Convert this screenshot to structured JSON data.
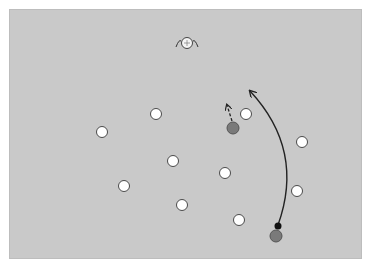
{
  "board": {
    "background": "#c9c9c9",
    "x": 9,
    "y": 9,
    "width": 353,
    "height": 250
  },
  "colors": {
    "white_marker": "#ffffff",
    "marker_stroke": "#4a4a4a",
    "gray_ball": "#7a7a7a",
    "black_dot": "#111111",
    "arrow": "#222222"
  },
  "white_markers": [
    {
      "x": 102,
      "y": 132
    },
    {
      "x": 156,
      "y": 114
    },
    {
      "x": 246,
      "y": 114
    },
    {
      "x": 302,
      "y": 142
    },
    {
      "x": 173,
      "y": 161
    },
    {
      "x": 225,
      "y": 173
    },
    {
      "x": 124,
      "y": 186
    },
    {
      "x": 297,
      "y": 191
    },
    {
      "x": 182,
      "y": 205
    },
    {
      "x": 239,
      "y": 220
    }
  ],
  "gray_balls": [
    {
      "x": 233,
      "y": 128
    },
    {
      "x": 276,
      "y": 236
    }
  ],
  "black_dots": [
    {
      "x": 278,
      "y": 226
    }
  ],
  "top_icon": {
    "x": 187,
    "y": 43,
    "name": "goal-marker"
  },
  "arrows": [
    {
      "type": "curved-solid",
      "from": [
        278,
        225
      ],
      "control": [
        300,
        150
      ],
      "to": [
        250,
        91
      ]
    },
    {
      "type": "dashed",
      "from": [
        232,
        121
      ],
      "to": [
        227,
        105
      ]
    }
  ]
}
